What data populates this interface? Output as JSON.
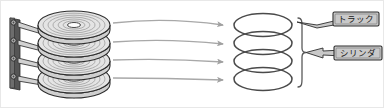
{
  "figure": {
    "background_color": "#ffffff",
    "border_color": "#e8e8e8"
  },
  "colors": {
    "platter_outline": "#3a3a3a",
    "platter_fill": "#e2e2e2",
    "track_ring": "#9a9a9a",
    "arm_dark": "#4a4a4a",
    "arm_body": "#cfcfcf",
    "arrow": "#a8a8a8",
    "ring_outline": "#4a4a4a",
    "brace": "#555555",
    "callout_fill": "#c9c9c9",
    "callout_border": "#2e2e2e",
    "callout_text": "#1a1a1a"
  },
  "disk_stack": {
    "name": "platter-stack",
    "platter_count": 4,
    "tracks_per_platter": 7,
    "has_spindle_hole": true,
    "spindle_axis": true
  },
  "actuator": {
    "name": "actuator-arm-assembly",
    "arm_count": 4,
    "pivot_count": 4
  },
  "arrows": {
    "name": "mapping-arrows",
    "count": 4,
    "direction": "left-to-right",
    "style": "curved"
  },
  "cylinder": {
    "name": "cylinder-rings",
    "ring_count": 4,
    "brace": true
  },
  "callouts": [
    {
      "id": "track",
      "label": "トラック",
      "target": "top-ring",
      "pointer": "left-down"
    },
    {
      "id": "cylinder",
      "label": "シリンダ",
      "target": "brace",
      "pointer": "left"
    }
  ]
}
